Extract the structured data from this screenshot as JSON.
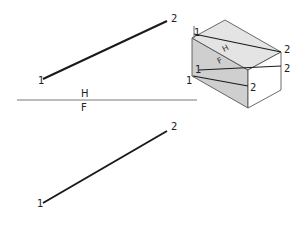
{
  "diagram": {
    "title": "",
    "top_view": {
      "line": {
        "x1": 43,
        "y1": 79,
        "x2": 167,
        "y2": 21
      },
      "labels": [
        {
          "text": "1",
          "x": 38,
          "y": 84
        },
        {
          "text": "2",
          "x": 171,
          "y": 22
        }
      ]
    },
    "fold_line": {
      "x1": 17,
      "y1": 100,
      "x2": 197,
      "y2": 100,
      "upper_label": "H",
      "lower_label": "F"
    },
    "front_view": {
      "line": {
        "x1": 43,
        "y1": 203,
        "x2": 167,
        "y2": 131
      },
      "labels": [
        {
          "text": "1",
          "x": 37,
          "y": 207
        },
        {
          "text": "2",
          "x": 171,
          "y": 130
        }
      ]
    },
    "pictorial": {
      "plane_labels": {
        "upper": "H",
        "lower": "F"
      },
      "point_labels": [
        {
          "text": "1",
          "x": 194,
          "y": 36
        },
        {
          "text": "2",
          "x": 284,
          "y": 53
        },
        {
          "text": "1",
          "x": 195,
          "y": 73
        },
        {
          "text": "2",
          "x": 284,
          "y": 72
        },
        {
          "text": "1",
          "x": 186,
          "y": 84
        },
        {
          "text": "2",
          "x": 250,
          "y": 91
        }
      ]
    },
    "colors": {
      "line": "#1a1a1a",
      "top_face": "#e4e4e4",
      "left_face": "#cfcfcf",
      "right_face": "#ffffff"
    }
  }
}
